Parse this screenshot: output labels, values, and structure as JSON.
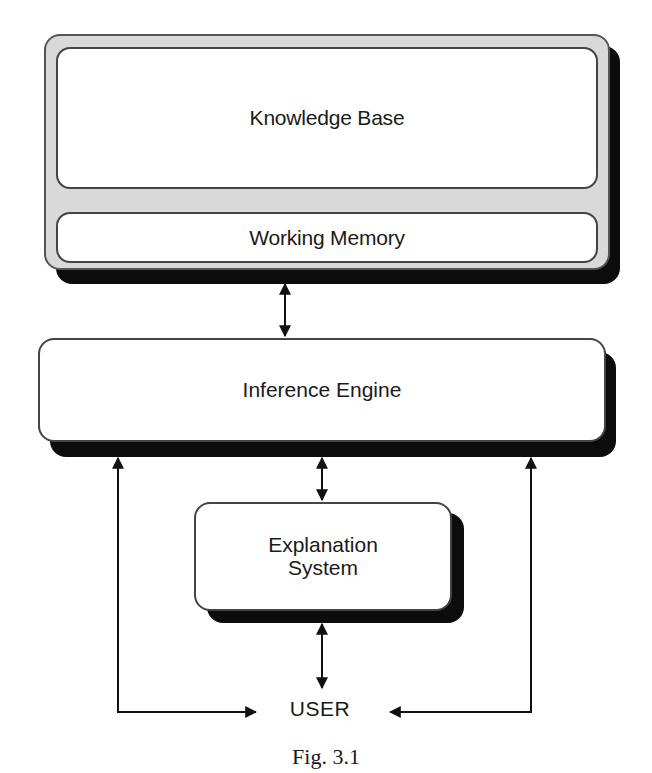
{
  "diagram": {
    "type": "block-diagram",
    "nodes": {
      "knowledge_base": {
        "label": "Knowledge Base"
      },
      "working_memory": {
        "label": "Working Memory"
      },
      "inference_engine": {
        "label": "Inference Engine"
      },
      "explanation_system": {
        "label_line1": "Explanation",
        "label_line2": "System"
      },
      "user": {
        "label": "USER"
      }
    },
    "edges": [
      {
        "from": "working_memory",
        "to": "inference_engine",
        "direction": "bidirectional"
      },
      {
        "from": "inference_engine",
        "to": "explanation_system",
        "direction": "bidirectional"
      },
      {
        "from": "explanation_system",
        "to": "user",
        "direction": "bidirectional"
      },
      {
        "from": "user",
        "to": "inference_engine",
        "path": "left-loop",
        "direction": "bidirectional"
      },
      {
        "from": "user",
        "to": "inference_engine",
        "path": "right-loop",
        "direction": "bidirectional"
      }
    ],
    "caption": "Fig. 3.1"
  },
  "colors": {
    "panel_fill": "#d9d9d9",
    "box_fill": "#ffffff",
    "shadow": "#0c0c0c",
    "stroke": "#111111"
  }
}
